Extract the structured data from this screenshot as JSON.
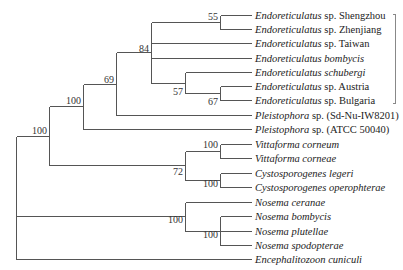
{
  "figure": {
    "type": "phylogenetic-tree",
    "taxa": [
      {
        "genus": "Endoreticulatus",
        "rest": " sp. Shengzhou"
      },
      {
        "genus": "Endoreticulatus",
        "rest": " sp. Zhenjiang"
      },
      {
        "genus": "Endoreticulatus",
        "rest": " sp. Taiwan"
      },
      {
        "genus": "Endoreticulatus bombycis",
        "rest": ""
      },
      {
        "genus": "Endoreticulatus schubergi",
        "rest": ""
      },
      {
        "genus": "Endoreticulatus",
        "rest": " sp. Austria"
      },
      {
        "genus": "Endoreticulatus",
        "rest": " sp. Bulgaria"
      },
      {
        "genus": "Pleistophora",
        "rest": " sp. (Sd-Nu-IW8201)"
      },
      {
        "genus": "Pleistophora",
        "rest": " sp. (ATCC 50040)"
      },
      {
        "genus": "Vittaforma corneum",
        "rest": ""
      },
      {
        "genus": "Vittaforma corneae",
        "rest": ""
      },
      {
        "genus": "Cystosporogenes legeri",
        "rest": ""
      },
      {
        "genus": "Cystosporogenes operophterae",
        "rest": ""
      },
      {
        "genus": "Nosema ceranae",
        "rest": ""
      },
      {
        "genus": "Nosema bombycis",
        "rest": ""
      },
      {
        "genus": "Nosema plutellae",
        "rest": ""
      },
      {
        "genus": "Nosema spodopterae",
        "rest": ""
      },
      {
        "genus": "Encephalitozoon cuniculi",
        "rest": ""
      }
    ],
    "bootstrap": {
      "shengzhou_zhenjiang": "55",
      "austria_bulgaria": "67",
      "schubergi_austria_bulgaria": "57",
      "endoreticulatus_clade": "84",
      "endo_pleisto_sd": "69",
      "endo_pleistophora": "100",
      "vittaforma": "100",
      "cystosporogenes": "100",
      "vitta_cysto": "72",
      "upper_group": "100",
      "nosema_inner": "100",
      "nosema": "100"
    },
    "bracket": "endoreticulatus-group"
  }
}
